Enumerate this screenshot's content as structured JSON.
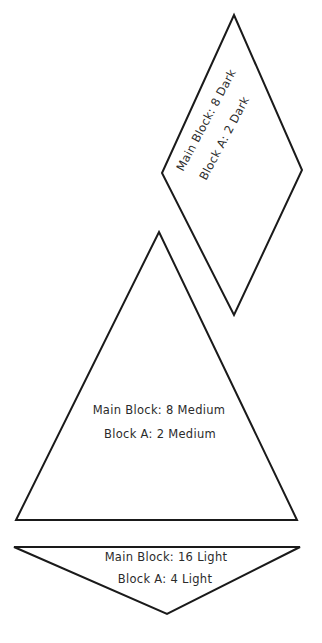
{
  "pieces": {
    "diamond": {
      "line1": "Main Block: 8 Dark",
      "line2": "Block A: 2 Dark"
    },
    "triangle": {
      "line1": "Main Block: 8 Medium",
      "line2": "Block A: 2 Medium"
    },
    "inverted_triangle": {
      "line1": "Main Block: 16 Light",
      "line2": "Block A: 4 Light"
    }
  }
}
